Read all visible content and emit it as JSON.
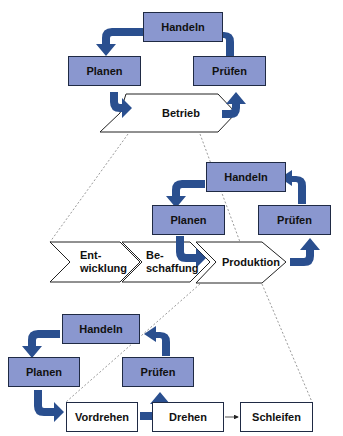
{
  "diagram": {
    "colors": {
      "box_fill": "#8a97cf",
      "arrow": "#2a4f8f",
      "border": "#1f2a44"
    },
    "level1": {
      "cycle": {
        "top": "Handeln",
        "left": "Planen",
        "right": "Prüfen"
      },
      "process": "Betrieb"
    },
    "level2": {
      "cycle": {
        "top": "Handeln",
        "left": "Planen",
        "right": "Prüfen"
      },
      "processes": [
        {
          "line1": "Ent-",
          "line2": "wicklung"
        },
        {
          "line1": "Be-",
          "line2": "schaffung"
        },
        {
          "line1": "Produktion",
          "line2": ""
        }
      ]
    },
    "level3": {
      "cycle": {
        "top": "Handeln",
        "left": "Planen",
        "right": "Prüfen"
      },
      "steps": [
        "Vordrehen",
        "Drehen",
        "Schleifen"
      ]
    }
  }
}
